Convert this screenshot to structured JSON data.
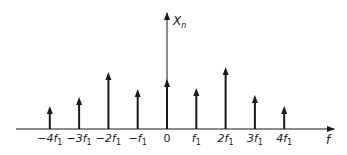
{
  "chart_data": {
    "type": "stem",
    "title": "",
    "xlabel": "f",
    "ylabel": "X_n",
    "ylabel_main": "X",
    "ylabel_sub": "n",
    "categories": [
      "-4f1",
      "-3f1",
      "-2f1",
      "-f1",
      "0",
      "f1",
      "2f1",
      "3f1",
      "4f1"
    ],
    "x": [
      -4,
      -3,
      -2,
      -1,
      0,
      1,
      2,
      3,
      4
    ],
    "values": [
      23,
      32,
      57,
      40,
      50,
      41,
      62,
      34,
      23
    ],
    "value_units": "relative magnitude (arbitrary, read from pixel heights)",
    "tick_labels": [
      {
        "main": "−4f",
        "sub": "1"
      },
      {
        "main": "−3f",
        "sub": "1"
      },
      {
        "main": "−2f",
        "sub": "1"
      },
      {
        "main": "−f",
        "sub": "1"
      },
      {
        "main": "0",
        "sub": ""
      },
      {
        "main": "f",
        "sub": "1"
      },
      {
        "main": "2f",
        "sub": "1"
      },
      {
        "main": "3f",
        "sub": "1"
      },
      {
        "main": "4f",
        "sub": "1"
      }
    ],
    "grid": false,
    "legend": null,
    "ylim": [
      0,
      115
    ],
    "colors": {
      "stroke": "#1a1a1a",
      "background": "#ffffff"
    }
  }
}
